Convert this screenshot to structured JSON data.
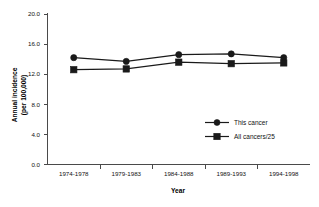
{
  "chart_data": {
    "type": "line",
    "title": "",
    "subtitle": "",
    "xlabel": "Year",
    "ylabel": "Annual incidence (per 100,000)",
    "ylabel_line1": "Annual incidence",
    "ylabel_line2": "(per 100,000)",
    "categories": [
      "1974-1978",
      "1979-1983",
      "1984-1988",
      "1989-1993",
      "1994-1998"
    ],
    "ylim": [
      0.0,
      20.0
    ],
    "yticks": [
      "0.0",
      "4.0",
      "8.0",
      "12.0",
      "16.0",
      "20.0"
    ],
    "ytick_values": [
      0.0,
      4.0,
      8.0,
      12.0,
      16.0,
      20.0
    ],
    "grid": false,
    "legend_position": "inside-lower-right",
    "series": [
      {
        "name": "This cancer",
        "marker": "circle",
        "color": "#1a1a1a",
        "values": [
          14.2,
          13.7,
          14.6,
          14.7,
          14.2
        ]
      },
      {
        "name": "All cancers/25",
        "marker": "square",
        "color": "#1a1a1a",
        "values": [
          12.6,
          12.7,
          13.6,
          13.4,
          13.5
        ]
      }
    ]
  },
  "legend": {
    "items": [
      {
        "label": "This cancer",
        "marker": "circle"
      },
      {
        "label": "All cancers/25",
        "marker": "square"
      }
    ]
  }
}
